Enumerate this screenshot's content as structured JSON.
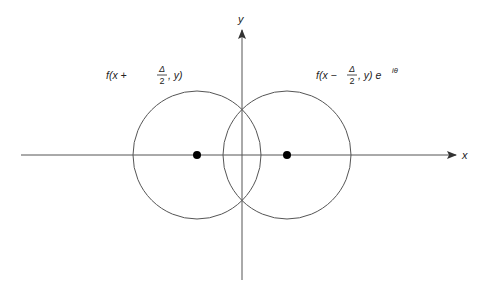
{
  "diagram": {
    "type": "overlapping-circles-on-axes",
    "axes": {
      "x_label": "x",
      "y_label": "y",
      "origin": [
        242,
        155
      ]
    },
    "circles": [
      {
        "name": "left",
        "center": [
          197,
          155
        ],
        "radius": 64,
        "label": {
          "prefix": "f(x + ",
          "frac_num": "Δ",
          "frac_den": "2",
          "suffix": ", y)",
          "exponent": ""
        }
      },
      {
        "name": "right",
        "center": [
          287,
          155
        ],
        "radius": 64,
        "label": {
          "prefix": "f(x − ",
          "frac_num": "Δ",
          "frac_den": "2",
          "suffix": ", y) e",
          "exponent": "iθ"
        }
      }
    ],
    "colors": {
      "line": "#444444",
      "dot": "#000000",
      "text": "#222222"
    }
  }
}
